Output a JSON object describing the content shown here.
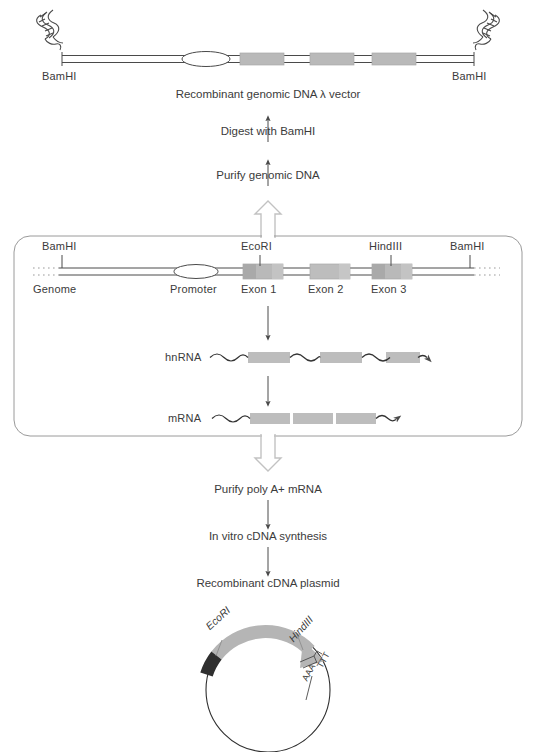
{
  "figure": {
    "colors": {
      "line": "#4a4a4a",
      "exon_fill": "#b9b9b9",
      "exon_edge": "#9a9a9a",
      "arc_gray": "#b5b5b5",
      "arc_dark": "#2f2f2f",
      "text": "#3b3b3b",
      "box_border": "#8c8c8c",
      "hollow_arrow": "#bdbdbd",
      "background": "#ffffff"
    }
  },
  "top_construct": {
    "left_site_label": "BamHI",
    "right_site_label": "BamHI",
    "caption": "Recombinant genomic DNA λ vector",
    "features": [
      "promoter-ellipse",
      "exon-box-1",
      "exon-box-2",
      "exon-box-3"
    ],
    "end_icons": [
      "dna-helix-left",
      "dna-helix-right"
    ]
  },
  "flow_up": {
    "step_1": "Digest with BamHI",
    "step_2": "Purify genomic DNA"
  },
  "genome_panel": {
    "sites": [
      {
        "label": "BamHI",
        "x": 62
      },
      {
        "label": "EcoRI",
        "x": 260
      },
      {
        "label": "HindIII",
        "x": 391
      },
      {
        "label": "BamHI",
        "x": 470
      }
    ],
    "below_labels": [
      {
        "label": "Genome",
        "x": 35
      },
      {
        "label": "Promoter",
        "x": 172
      },
      {
        "label": "Exon 1",
        "x": 248
      },
      {
        "label": "Exon 2",
        "x": 318
      },
      {
        "label": "Exon 3",
        "x": 382
      }
    ],
    "transcripts": [
      {
        "name": "hnRNA",
        "label": "hnRNA"
      },
      {
        "name": "mRNA",
        "label": "mRNA"
      }
    ]
  },
  "flow_down": {
    "step_1": "Purify poly A+ mRNA",
    "step_2": "In vitro cDNA synthesis",
    "step_3": "Recombinant cDNA plasmid"
  },
  "plasmid": {
    "label_ecori": "EcoRI",
    "label_hindiii": "HindIII",
    "label_aaa": "AAA",
    "label_ttt": "TTT"
  }
}
